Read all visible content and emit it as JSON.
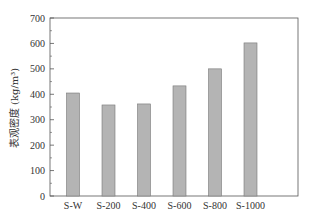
{
  "chart_data": {
    "type": "bar",
    "title": "",
    "xlabel": "",
    "ylabel": "表观密度 (kg/m³)",
    "categories": [
      "S-W",
      "S-200",
      "S-400",
      "S-600",
      "S-800",
      "S-1000"
    ],
    "values": [
      405,
      358,
      362,
      433,
      500,
      602
    ],
    "ylim": [
      0,
      700
    ],
    "yticks": [
      0,
      100,
      200,
      300,
      400,
      500,
      600,
      700
    ],
    "grid": false,
    "legend": null,
    "bar_color": "#b4b4b4",
    "bar_edge_color": "#777777",
    "axis_color": "#555555"
  }
}
